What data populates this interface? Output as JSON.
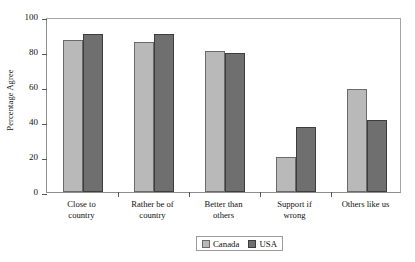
{
  "chart_data": {
    "type": "bar",
    "title": "",
    "xlabel": "",
    "ylabel": "Percentage Agree",
    "categories": [
      "Close to country",
      "Rather be of country",
      "Better than others",
      "Support if wrong",
      "Others like us"
    ],
    "category_lines": [
      [
        "Close to",
        "country"
      ],
      [
        "Rather be of",
        "country"
      ],
      [
        "Better than",
        "others"
      ],
      [
        "Support if",
        "wrong"
      ],
      [
        "Others like us"
      ]
    ],
    "series": [
      {
        "name": "Canada",
        "color": "#b9b9b9",
        "values": [
          87,
          86,
          80.5,
          20,
          59
        ]
      },
      {
        "name": "USA",
        "color": "#6f6f6f",
        "values": [
          90.5,
          90.5,
          79.5,
          37,
          41
        ]
      }
    ],
    "ylim": [
      0,
      100
    ],
    "yticks": [
      0,
      20,
      40,
      60,
      80,
      100
    ],
    "ytick_labels": [
      "0",
      "20",
      "40",
      "60",
      "80",
      "100"
    ],
    "grid": false,
    "legend_position": "bottom-center",
    "legend": [
      {
        "label": "Canada",
        "swatch": "canada"
      },
      {
        "label": "USA",
        "swatch": "usa"
      }
    ]
  }
}
